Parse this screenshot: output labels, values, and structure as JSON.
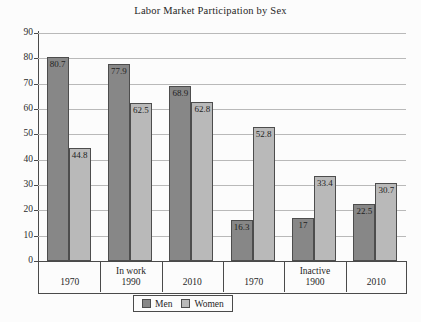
{
  "chart_data": {
    "type": "bar",
    "title": "Labor Market Participation by Sex",
    "xlabel": "",
    "ylabel": "",
    "ylim": [
      0,
      90
    ],
    "yticks": [
      0,
      10,
      20,
      30,
      40,
      50,
      60,
      70,
      80,
      90
    ],
    "grid": true,
    "legend_position": "bottom-center",
    "categories": [
      "1970",
      "In work\n1990",
      "2010",
      "1970",
      "Inactive\n1900",
      "2010"
    ],
    "category_lines": [
      [
        "1970"
      ],
      [
        "In work",
        "1990"
      ],
      [
        "2010"
      ],
      [
        "1970"
      ],
      [
        "Inactive",
        "1900"
      ],
      [
        "2010"
      ]
    ],
    "series": [
      {
        "name": "Men",
        "color": "#878787",
        "values": [
          80.7,
          77.9,
          68.9,
          16.3,
          17,
          22.5
        ],
        "labels": [
          "80.7",
          "77.9",
          "68.9",
          "16.3",
          "17",
          "22.5"
        ]
      },
      {
        "name": "Women",
        "color": "#b9b9b9",
        "values": [
          44.8,
          62.5,
          62.8,
          52.8,
          33.4,
          30.7
        ],
        "labels": [
          "44.8",
          "62.5",
          "62.8",
          "52.8",
          "33.4",
          "30.7"
        ]
      }
    ]
  },
  "colors": {
    "men": "#878787",
    "women": "#b9b9b9",
    "axis": "#4a4a4a",
    "grid": "#b9b9b9",
    "background": "#fcfcfc"
  }
}
